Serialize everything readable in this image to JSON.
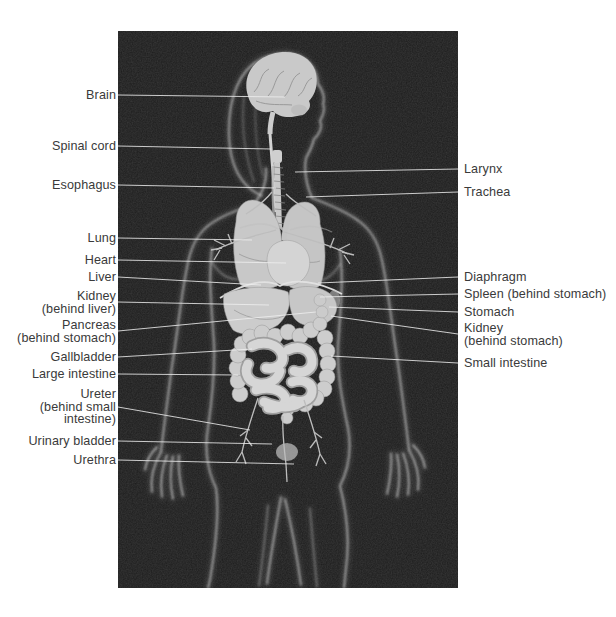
{
  "figure": {
    "frame": {
      "x": 118,
      "y": 31,
      "width": 340,
      "height": 557
    },
    "colors": {
      "page_background": "#ffffff",
      "backdrop": "#1c1c1c",
      "label_text": "#3a3a3a",
      "leader_line": "#eeeeee",
      "organ_light": "#cccccc",
      "body_outline": "#dcdcdc"
    },
    "labels": {
      "left": [
        {
          "text": "Brain",
          "y": 95,
          "target": [
            285,
            97
          ]
        },
        {
          "text": "Spinal cord",
          "y": 146,
          "target": [
            271,
            149
          ]
        },
        {
          "text": "Esophagus",
          "y": 185,
          "target": [
            276,
            188
          ]
        },
        {
          "text": "Lung",
          "y": 238,
          "target": [
            252,
            240
          ]
        },
        {
          "text": "Heart",
          "y": 260,
          "target": [
            286,
            263
          ]
        },
        {
          "text": "Liver",
          "y": 277,
          "target": [
            261,
            285
          ]
        },
        {
          "text": "Kidney\n(behind liver)",
          "y": 302,
          "target": [
            269,
            305
          ]
        },
        {
          "text": "Pancreas\n(behind stomach)",
          "y": 331,
          "target": [
            316,
            312
          ]
        },
        {
          "text": "Gallbladder",
          "y": 357,
          "target": [
            252,
            349
          ]
        },
        {
          "text": "Large intestine",
          "y": 374,
          "target": [
            238,
            375
          ]
        },
        {
          "text": "Ureter\n(behind small\nintestine)",
          "y": 407,
          "target": [
            250,
            430
          ]
        },
        {
          "text": "Urinary bladder",
          "y": 441,
          "target": [
            272,
            444
          ]
        },
        {
          "text": "Urethra",
          "y": 460,
          "target": [
            294,
            464
          ]
        }
      ],
      "right": [
        {
          "text": "Larynx",
          "y": 169,
          "target": [
            295,
            172
          ]
        },
        {
          "text": "Trachea",
          "y": 192,
          "target": [
            306,
            197
          ]
        },
        {
          "text": "Diaphragm",
          "y": 277,
          "target": [
            318,
            283
          ]
        },
        {
          "text": "Spleen (behind stomach)",
          "y": 294,
          "target": [
            320,
            297
          ]
        },
        {
          "text": "Stomach",
          "y": 312,
          "target": [
            329,
            307
          ]
        },
        {
          "text": "Kidney\n(behind stomach)",
          "y": 334,
          "target": [
            331,
            316
          ]
        },
        {
          "text": "Small intestine",
          "y": 363,
          "target": [
            331,
            356
          ]
        }
      ]
    }
  }
}
